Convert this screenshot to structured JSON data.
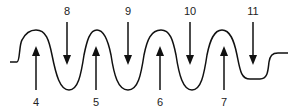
{
  "diagram": {
    "colors": {
      "line": "#111111",
      "arrow": "#111111",
      "text": "#222222"
    },
    "up_arrows": [
      {
        "label": "4",
        "x": 36
      },
      {
        "label": "5",
        "x": 96
      },
      {
        "label": "6",
        "x": 160
      },
      {
        "label": "7",
        "x": 224
      }
    ],
    "down_arrows": [
      {
        "label": "8",
        "x": 67
      },
      {
        "label": "9",
        "x": 128
      },
      {
        "label": "10",
        "x": 190
      },
      {
        "label": "11",
        "x": 253
      }
    ]
  }
}
